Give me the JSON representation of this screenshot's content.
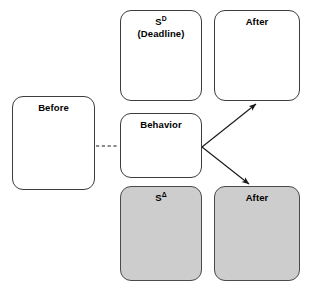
{
  "diagram": {
    "colors": {
      "box_fill_white": "#ffffff",
      "box_fill_shaded": "#cdcdcd",
      "box_stroke": "#3d3d3d",
      "connector_stroke": "#1a1a1a",
      "text": "#000000",
      "background": "#ffffff"
    },
    "nodes": {
      "before": {
        "label": "Before",
        "shaded": false
      },
      "antecedent_deadline": {
        "label_main": "S",
        "label_superscript": "D",
        "label_sub_line": "(Deadline)",
        "shaded": false
      },
      "after_top": {
        "label": "After",
        "shaded": false
      },
      "behavior": {
        "label": "Behavior",
        "shaded": false
      },
      "antecedent_delta": {
        "label_main": "S",
        "label_superscript": "Δ",
        "shaded": true
      },
      "after_bottom": {
        "label": "After",
        "shaded": true
      }
    },
    "connectors": [
      {
        "name": "before-to-behavior",
        "style": "dashed",
        "arrowhead": false
      },
      {
        "name": "behavior-to-after-top",
        "style": "solid",
        "arrowhead": true
      },
      {
        "name": "behavior-to-after-bottom",
        "style": "solid",
        "arrowhead": true
      }
    ]
  }
}
